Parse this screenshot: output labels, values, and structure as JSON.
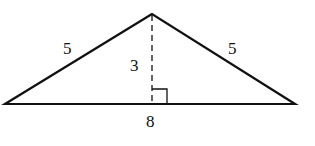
{
  "diagram": {
    "type": "isosceles-triangle",
    "colors": {
      "stroke": "#111111",
      "background": "#ffffff"
    },
    "vertices": {
      "apex": [
        152,
        14
      ],
      "left": [
        5,
        104
      ],
      "right": [
        295,
        104
      ],
      "foot": [
        152,
        104
      ]
    },
    "labels": {
      "left_side": "5",
      "right_side": "5",
      "height": "3",
      "base": "8"
    },
    "right_angle_marker": true,
    "height_line_style": "dashed"
  }
}
